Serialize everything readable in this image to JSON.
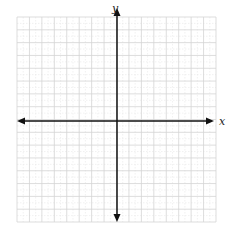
{
  "diagram": {
    "type": "coordinate-plane",
    "x_axis_label": "x",
    "y_axis_label": "y",
    "grid": {
      "columns": 16,
      "rows": 16,
      "left": 17,
      "top": 17,
      "right": 216,
      "bottom": 222,
      "line_color": "#d4d4d4",
      "minor_color": "#e8e8e8"
    },
    "axes": {
      "origin_x": 117,
      "origin_y": 121,
      "x_start": 17,
      "x_end": 214,
      "y_start": 8,
      "y_end": 222,
      "color": "#111111"
    }
  }
}
